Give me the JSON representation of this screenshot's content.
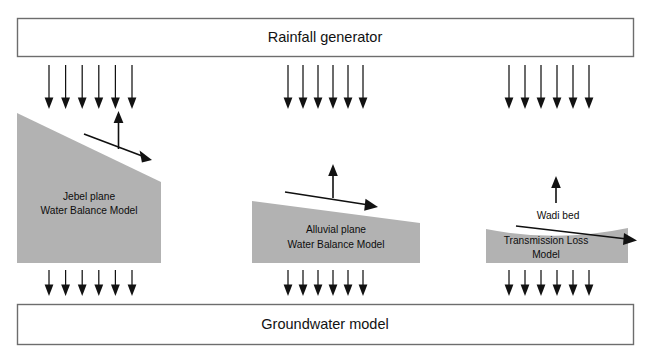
{
  "figure": {
    "top_box": {
      "label": "Rainfall generator"
    },
    "bottom_box": {
      "label": "Groundwater model"
    },
    "units": [
      {
        "id": "jebel",
        "label_line1": "Jebel plane",
        "label_line2": "Water Balance Model",
        "rain_arrow_count": 6,
        "recharge_arrow_count": 6,
        "has_evaporation_arrow": true,
        "has_runoff_arrow": true
      },
      {
        "id": "alluvial",
        "label_line1": "Alluvial plane",
        "label_line2": "Water Balance Model",
        "rain_arrow_count": 6,
        "recharge_arrow_count": 6,
        "has_evaporation_arrow": true,
        "has_runoff_arrow": true
      },
      {
        "id": "wadi",
        "label_line1": "Wadi bed",
        "label_line2": "Transmission Loss",
        "label_line3": "Model",
        "rain_arrow_count": 6,
        "recharge_arrow_count": 6,
        "has_evaporation_arrow": true,
        "has_runoff_arrow": true
      }
    ]
  },
  "colors": {
    "terrain_gray": "#b2b2b2",
    "box_border": "#6d6d6d",
    "arrow_black": "#121212",
    "background": "#ffffff"
  }
}
